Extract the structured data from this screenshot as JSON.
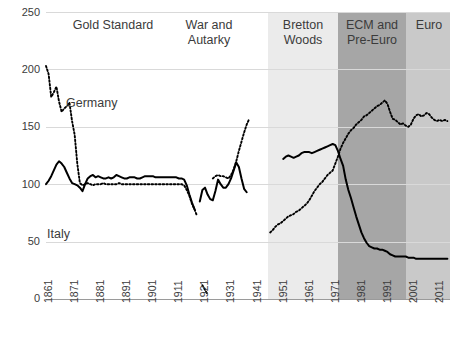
{
  "chart_data": {
    "type": "line",
    "title": "",
    "xlabel": "",
    "ylabel": "",
    "ylim": [
      0,
      250
    ],
    "xlim": [
      1861,
      2016
    ],
    "grid": true,
    "legend_position": "inline-annotations",
    "y_ticks": [
      0,
      50,
      100,
      150,
      200,
      250
    ],
    "x_ticks": [
      1861,
      1871,
      1881,
      1891,
      1901,
      1911,
      1921,
      1931,
      1941,
      1951,
      1961,
      1971,
      1981,
      1991,
      2001,
      2011
    ],
    "annotations": [
      {
        "name": "Gold Standard",
        "text": "Gold Standard",
        "x_start": 1861,
        "x_end": 1914
      },
      {
        "name": "War and Autarky",
        "text": "War and\nAutarky",
        "x_start": 1914,
        "x_end": 1946
      },
      {
        "name": "Bretton Woods",
        "text": "Bretton\nWoods",
        "x_start": 1946,
        "x_end": 1973
      },
      {
        "name": "ECM and Pre-Euro",
        "text": "ECM and\nPre-Euro",
        "x_start": 1973,
        "x_end": 1999
      },
      {
        "name": "Euro",
        "text": "Euro",
        "x_start": 1999,
        "x_end": 2016
      }
    ],
    "bands": [
      {
        "name": "Gold Standard",
        "color": "#ffffff",
        "x_start": 1861,
        "x_end": 1946
      },
      {
        "name": "Bretton Woods",
        "color": "#ebebeb",
        "x_start": 1946,
        "x_end": 1973
      },
      {
        "name": "ECM and Pre-Euro",
        "color": "#a6a6a6",
        "x_start": 1973,
        "x_end": 1999
      },
      {
        "name": "Euro",
        "color": "#c9c9c9",
        "x_start": 1999,
        "x_end": 2016
      }
    ],
    "series": [
      {
        "name": "Germany",
        "label": "Germany",
        "style": "dotted",
        "color": "#000000",
        "points": [
          [
            1861,
            203
          ],
          [
            1862,
            196
          ],
          [
            1863,
            176
          ],
          [
            1864,
            180
          ],
          [
            1865,
            185
          ],
          [
            1866,
            172
          ],
          [
            1867,
            163
          ],
          [
            1868,
            166
          ],
          [
            1869,
            168
          ],
          [
            1870,
            171
          ],
          [
            1871,
            155
          ],
          [
            1872,
            143
          ],
          [
            1873,
            118
          ],
          [
            1874,
            101
          ],
          [
            1875,
            99
          ],
          [
            1876,
            100
          ],
          [
            1877,
            101
          ],
          [
            1878,
            100
          ],
          [
            1879,
            99
          ],
          [
            1880,
            100
          ],
          [
            1881,
            100
          ],
          [
            1882,
            100
          ],
          [
            1883,
            101
          ],
          [
            1884,
            100
          ],
          [
            1885,
            100
          ],
          [
            1886,
            100
          ],
          [
            1887,
            100
          ],
          [
            1888,
            100
          ],
          [
            1889,
            101
          ],
          [
            1890,
            100
          ],
          [
            1891,
            100
          ],
          [
            1892,
            100
          ],
          [
            1893,
            100
          ],
          [
            1894,
            100
          ],
          [
            1895,
            100
          ],
          [
            1896,
            100
          ],
          [
            1897,
            100
          ],
          [
            1898,
            100
          ],
          [
            1899,
            100
          ],
          [
            1900,
            100
          ],
          [
            1901,
            100
          ],
          [
            1902,
            100
          ],
          [
            1903,
            100
          ],
          [
            1904,
            100
          ],
          [
            1905,
            100
          ],
          [
            1906,
            100
          ],
          [
            1907,
            100
          ],
          [
            1908,
            100
          ],
          [
            1909,
            100
          ],
          [
            1910,
            100
          ],
          [
            1911,
            100
          ],
          [
            1912,
            100
          ],
          [
            1913,
            100
          ],
          [
            1914,
            99
          ],
          [
            1915,
            95
          ],
          [
            1916,
            90
          ],
          [
            1917,
            83
          ],
          [
            1918,
            78
          ],
          [
            1919,
            72
          ],
          [
            1921,
            12
          ],
          [
            1922,
            8
          ],
          [
            1923,
            4
          ],
          [
            1925,
            105
          ],
          [
            1926,
            107
          ],
          [
            1927,
            108
          ],
          [
            1928,
            107
          ],
          [
            1929,
            107
          ],
          [
            1930,
            106
          ],
          [
            1931,
            105
          ],
          [
            1932,
            108
          ],
          [
            1933,
            113
          ],
          [
            1934,
            120
          ],
          [
            1935,
            129
          ],
          [
            1936,
            137
          ],
          [
            1937,
            145
          ],
          [
            1938,
            152
          ],
          [
            1939,
            157
          ],
          [
            1947,
            58
          ],
          [
            1948,
            60
          ],
          [
            1949,
            63
          ],
          [
            1950,
            65
          ],
          [
            1951,
            66
          ],
          [
            1952,
            68
          ],
          [
            1953,
            70
          ],
          [
            1954,
            72
          ],
          [
            1955,
            73
          ],
          [
            1956,
            74
          ],
          [
            1957,
            76
          ],
          [
            1958,
            77
          ],
          [
            1959,
            79
          ],
          [
            1960,
            81
          ],
          [
            1961,
            83
          ],
          [
            1962,
            86
          ],
          [
            1963,
            90
          ],
          [
            1964,
            94
          ],
          [
            1965,
            97
          ],
          [
            1966,
            100
          ],
          [
            1967,
            102
          ],
          [
            1968,
            105
          ],
          [
            1969,
            108
          ],
          [
            1970,
            110
          ],
          [
            1971,
            112
          ],
          [
            1972,
            118
          ],
          [
            1973,
            124
          ],
          [
            1974,
            131
          ],
          [
            1975,
            136
          ],
          [
            1976,
            140
          ],
          [
            1977,
            144
          ],
          [
            1978,
            147
          ],
          [
            1979,
            149
          ],
          [
            1980,
            152
          ],
          [
            1981,
            154
          ],
          [
            1982,
            156
          ],
          [
            1983,
            159
          ],
          [
            1984,
            160
          ],
          [
            1985,
            162
          ],
          [
            1986,
            164
          ],
          [
            1987,
            166
          ],
          [
            1988,
            168
          ],
          [
            1989,
            169
          ],
          [
            1990,
            171
          ],
          [
            1991,
            173
          ],
          [
            1992,
            170
          ],
          [
            1993,
            163
          ],
          [
            1994,
            157
          ],
          [
            1995,
            156
          ],
          [
            1996,
            154
          ],
          [
            1997,
            152
          ],
          [
            1998,
            153
          ],
          [
            1999,
            151
          ],
          [
            2000,
            150
          ],
          [
            2001,
            152
          ],
          [
            2002,
            157
          ],
          [
            2003,
            160
          ],
          [
            2004,
            161
          ],
          [
            2005,
            159
          ],
          [
            2006,
            160
          ],
          [
            2007,
            162
          ],
          [
            2008,
            161
          ],
          [
            2009,
            158
          ],
          [
            2010,
            156
          ],
          [
            2011,
            155
          ],
          [
            2012,
            156
          ],
          [
            2013,
            155
          ],
          [
            2014,
            156
          ],
          [
            2015,
            155
          ]
        ]
      },
      {
        "name": "Italy",
        "label": "Italy",
        "style": "solid",
        "color": "#000000",
        "points": [
          [
            1861,
            100
          ],
          [
            1862,
            103
          ],
          [
            1863,
            107
          ],
          [
            1864,
            112
          ],
          [
            1865,
            117
          ],
          [
            1866,
            120
          ],
          [
            1867,
            118
          ],
          [
            1868,
            115
          ],
          [
            1869,
            110
          ],
          [
            1870,
            105
          ],
          [
            1871,
            101
          ],
          [
            1872,
            100
          ],
          [
            1873,
            99
          ],
          [
            1874,
            97
          ],
          [
            1875,
            94
          ],
          [
            1876,
            100
          ],
          [
            1877,
            105
          ],
          [
            1878,
            107
          ],
          [
            1879,
            108
          ],
          [
            1880,
            106
          ],
          [
            1881,
            107
          ],
          [
            1882,
            106
          ],
          [
            1883,
            105
          ],
          [
            1884,
            105
          ],
          [
            1885,
            106
          ],
          [
            1886,
            105
          ],
          [
            1887,
            106
          ],
          [
            1888,
            108
          ],
          [
            1889,
            107
          ],
          [
            1890,
            106
          ],
          [
            1891,
            105
          ],
          [
            1892,
            105
          ],
          [
            1893,
            106
          ],
          [
            1894,
            106
          ],
          [
            1895,
            106
          ],
          [
            1896,
            105
          ],
          [
            1897,
            105
          ],
          [
            1898,
            106
          ],
          [
            1899,
            107
          ],
          [
            1900,
            107
          ],
          [
            1901,
            107
          ],
          [
            1902,
            107
          ],
          [
            1903,
            106
          ],
          [
            1904,
            106
          ],
          [
            1905,
            106
          ],
          [
            1906,
            106
          ],
          [
            1907,
            106
          ],
          [
            1908,
            106
          ],
          [
            1909,
            106
          ],
          [
            1910,
            106
          ],
          [
            1911,
            106
          ],
          [
            1912,
            105
          ],
          [
            1913,
            105
          ],
          [
            1914,
            104
          ],
          [
            1915,
            99
          ],
          [
            1916,
            91
          ],
          [
            1917,
            84
          ],
          [
            1918,
            78
          ],
          [
            1920,
            85
          ],
          [
            1921,
            95
          ],
          [
            1922,
            97
          ],
          [
            1923,
            91
          ],
          [
            1924,
            87
          ],
          [
            1925,
            86
          ],
          [
            1926,
            94
          ],
          [
            1927,
            104
          ],
          [
            1928,
            100
          ],
          [
            1929,
            97
          ],
          [
            1930,
            97
          ],
          [
            1931,
            100
          ],
          [
            1932,
            105
          ],
          [
            1933,
            112
          ],
          [
            1934,
            119
          ],
          [
            1935,
            115
          ],
          [
            1936,
            105
          ],
          [
            1937,
            96
          ],
          [
            1938,
            93
          ],
          [
            1952,
            122
          ],
          [
            1953,
            124
          ],
          [
            1954,
            125
          ],
          [
            1955,
            124
          ],
          [
            1956,
            123
          ],
          [
            1957,
            124
          ],
          [
            1958,
            125
          ],
          [
            1959,
            127
          ],
          [
            1960,
            128
          ],
          [
            1961,
            128
          ],
          [
            1962,
            128
          ],
          [
            1963,
            127
          ],
          [
            1964,
            128
          ],
          [
            1965,
            129
          ],
          [
            1966,
            130
          ],
          [
            1967,
            131
          ],
          [
            1968,
            132
          ],
          [
            1969,
            133
          ],
          [
            1970,
            134
          ],
          [
            1971,
            135
          ],
          [
            1972,
            134
          ],
          [
            1973,
            129
          ],
          [
            1974,
            122
          ],
          [
            1975,
            116
          ],
          [
            1976,
            104
          ],
          [
            1977,
            95
          ],
          [
            1978,
            88
          ],
          [
            1979,
            80
          ],
          [
            1980,
            72
          ],
          [
            1981,
            65
          ],
          [
            1982,
            58
          ],
          [
            1983,
            53
          ],
          [
            1984,
            49
          ],
          [
            1985,
            46
          ],
          [
            1986,
            45
          ],
          [
            1987,
            44
          ],
          [
            1988,
            44
          ],
          [
            1989,
            43
          ],
          [
            1990,
            43
          ],
          [
            1991,
            42
          ],
          [
            1992,
            41
          ],
          [
            1993,
            39
          ],
          [
            1994,
            38
          ],
          [
            1995,
            37
          ],
          [
            1996,
            37
          ],
          [
            1997,
            37
          ],
          [
            1998,
            37
          ],
          [
            1999,
            37
          ],
          [
            2000,
            36
          ],
          [
            2001,
            36
          ],
          [
            2002,
            36
          ],
          [
            2003,
            35
          ],
          [
            2004,
            35
          ],
          [
            2005,
            35
          ],
          [
            2006,
            35
          ],
          [
            2007,
            35
          ],
          [
            2008,
            35
          ],
          [
            2009,
            35
          ],
          [
            2010,
            35
          ],
          [
            2011,
            35
          ],
          [
            2012,
            35
          ],
          [
            2013,
            35
          ],
          [
            2014,
            35
          ],
          [
            2015,
            35
          ]
        ]
      }
    ]
  },
  "axis": {
    "y_labels": [
      "250",
      "200",
      "150",
      "100",
      "50",
      "0"
    ],
    "x_labels": [
      "1861",
      "1871",
      "1881",
      "1891",
      "1901",
      "1911",
      "1921",
      "1931",
      "1941",
      "1951",
      "1961",
      "1971",
      "1981",
      "1991",
      "2001",
      "2011"
    ]
  },
  "eras": {
    "gold_standard": "Gold Standard",
    "war_line1": "War and",
    "war_line2": "Autarky",
    "bretton_line1": "Bretton",
    "bretton_line2": "Woods",
    "ecm_line1": "ECM and",
    "ecm_line2": "Pre-Euro",
    "euro": "Euro"
  },
  "series_labels": {
    "germany": "Germany",
    "italy": "Italy"
  },
  "colors": {
    "band_bretton": "#ebebeb",
    "band_ecm": "#a6a6a6",
    "band_euro": "#c9c9c9",
    "line": "#000000",
    "grid": "#d9d9d9",
    "text": "#3b3b3b"
  }
}
